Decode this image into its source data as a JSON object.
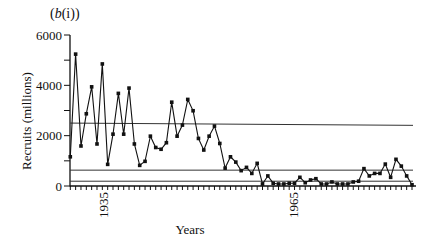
{
  "chart_data": {
    "type": "line",
    "panel_label": "(b(i))",
    "title": "",
    "xlabel": "Years",
    "ylabel": "Recruits (millions)",
    "ylim": [
      0,
      6000
    ],
    "yticks": [
      0,
      2000,
      4000,
      6000
    ],
    "yticks_minor": [
      1000,
      3000,
      5000
    ],
    "xtick_labels": [
      {
        "label": "1935",
        "x_px": 103
      },
      {
        "label": "1965",
        "x_px": 293
      }
    ],
    "x_ticks_annual": true,
    "grid": false,
    "legend": null,
    "series": [
      {
        "name": "Recruits",
        "marker": "square",
        "values": [
          1160,
          5240,
          1590,
          2870,
          3940,
          1670,
          4850,
          860,
          2060,
          3680,
          2060,
          3890,
          1670,
          820,
          980,
          1980,
          1530,
          1460,
          1720,
          3330,
          1980,
          2420,
          3440,
          2990,
          1890,
          1430,
          1980,
          2380,
          1690,
          710,
          1160,
          950,
          610,
          740,
          500,
          900,
          80,
          400,
          110,
          80,
          80,
          110,
          110,
          345,
          130,
          240,
          290,
          80,
          80,
          160,
          80,
          80,
          80,
          160,
          190,
          690,
          400,
          500,
          500,
          870,
          345,
          1060,
          790,
          400,
          50
        ]
      }
    ],
    "reference_lines": [
      {
        "name": "upper-reference-line",
        "y_start": 2500,
        "y_end": 2410
      },
      {
        "name": "middle-reference-line",
        "y_start": 630,
        "y_end": 630
      },
      {
        "name": "lower-reference-line",
        "y_start": 190,
        "y_end": 190
      }
    ]
  }
}
